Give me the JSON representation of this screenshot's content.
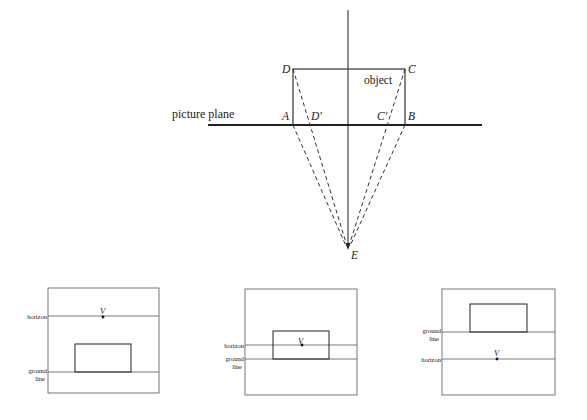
{
  "top_diagram": {
    "labels": {
      "picture_plane": "picture plane",
      "object": "object",
      "A": "A",
      "B": "B",
      "C": "C",
      "D": "D",
      "D_prime": "D′",
      "C_prime": "C′",
      "E": "E"
    }
  },
  "panels": [
    {
      "horizon_label": "horizon",
      "ground_label_1": "ground",
      "ground_label_2": "line",
      "vanishing_point": "V"
    },
    {
      "horizon_label": "horizon",
      "ground_label_1": "ground",
      "ground_label_2": "line",
      "vanishing_point": "V"
    },
    {
      "horizon_label": "horizon",
      "ground_label_1": "ground",
      "ground_label_2": "line",
      "vanishing_point": "V"
    }
  ]
}
